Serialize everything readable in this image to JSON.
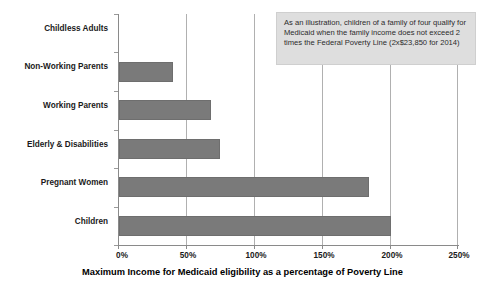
{
  "chart_data": {
    "type": "bar",
    "orientation": "horizontal",
    "title": "",
    "xlabel": "Maximum Income for Medicaid eligibility as a percentage of Poverty Line",
    "ylabel": "",
    "categories": [
      "Childless Adults",
      "Non-Working Parents",
      "Working Parents",
      "Elderly & Disabilities",
      "Pregnant Women",
      "Children"
    ],
    "values": [
      0,
      40,
      68,
      74,
      184,
      200
    ],
    "value_unit": "%",
    "xlim": [
      0,
      250
    ],
    "xticks": [
      0,
      50,
      100,
      150,
      200,
      250
    ],
    "xtick_labels": [
      "0%",
      "50%",
      "100%",
      "150%",
      "200%",
      "250%"
    ],
    "grid": "vertical",
    "legend": "none",
    "series": [
      {
        "name": "Maximum Income for Medicaid eligibility",
        "values": [
          0,
          40,
          68,
          74,
          184,
          200
        ],
        "color": "#7a7a7a"
      }
    ],
    "annotations": [
      {
        "name": "illustration-callout",
        "text": "As an illustration, children of a family of four qualify for Medicaid when the family income does not exceed 2 times the Federal Poverty Line (2x$23,850 for 2014)",
        "background": "#dedede",
        "border": "#cfcfcf"
      }
    ],
    "colors": {
      "bar": "#7a7a7a",
      "bar_border": "#6e6e6e",
      "gridline": "#b0b0b0",
      "axis": "#8a8a8a",
      "text": "#1a1a1a",
      "background": "#ffffff"
    }
  }
}
